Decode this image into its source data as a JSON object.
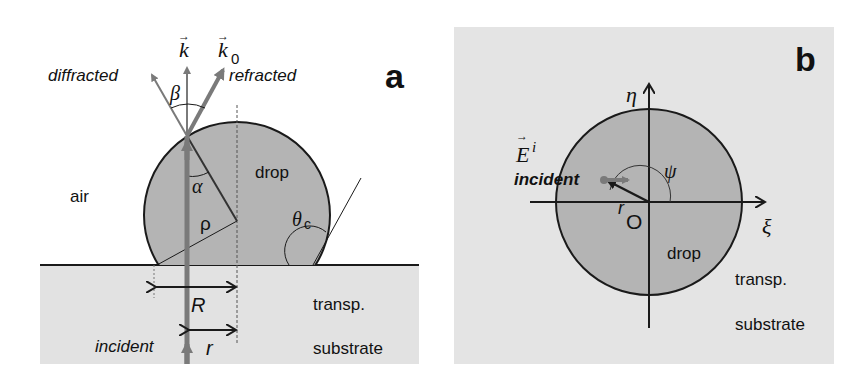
{
  "colors": {
    "background": "#ffffff",
    "drop_fill": "#b4b4b4",
    "substrate_fill": "#e2e2e2",
    "panel_b_bg": "#e4e4e4",
    "beam": "#7a7a7a",
    "outline": "#1a1a1a"
  },
  "panel_a": {
    "label": "a",
    "medium_label": "air",
    "drop_label": "drop",
    "substrate_label_1": "transp.",
    "substrate_label_2": "substrate",
    "incident_label": "incident",
    "diffracted_label": "diffracted",
    "refracted_label": "refracted",
    "k_vector": "k",
    "k0_vector": "k",
    "k0_subscript": "0",
    "angle_beta": "β",
    "angle_alpha": "α",
    "radius_rho": "ρ",
    "contact_angle": "θ",
    "contact_angle_subscript": "c",
    "dim_R": "R",
    "dim_r": "r"
  },
  "panel_b": {
    "label": "b",
    "axis_eta": "η",
    "axis_xi": "ξ",
    "field_vector": "E",
    "field_superscript": "i",
    "incident_label": "incident",
    "angle_psi": "ψ",
    "radius_r": "r",
    "origin_label": "O",
    "drop_label": "drop",
    "substrate_label_1": "transp.",
    "substrate_label_2": "substrate"
  }
}
